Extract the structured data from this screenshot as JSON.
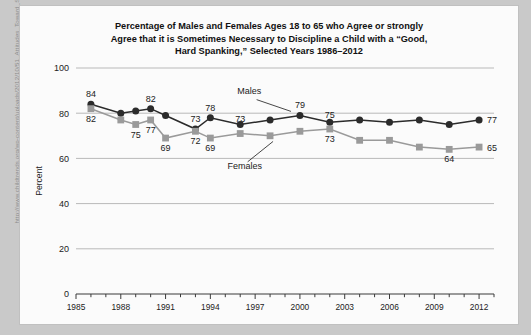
{
  "source_url": "http://www.childtrends.org/wp-content/uploads/2012/10/51_Attitudes_Toward_Spanking.pdf",
  "chart_data": {
    "type": "line",
    "title": "Percentage of Males and Females Ages 18 to 65 who Agree or strongly Agree that it is Sometimes Necessary to Discipline a Child with a “Good, Hard Spanking,” Selected Years 1986–2012",
    "title_lines": [
      "Percentage of Males and Females Ages 18 to 65 who Agree or strongly",
      "Agree that it is Sometimes Necessary to Discipline a Child with a “Good,",
      "Hard Spanking,” Selected Years 1986–2012"
    ],
    "xlabel": "",
    "ylabel": "Percent",
    "ylim": [
      0,
      100
    ],
    "yticks": [
      0,
      20,
      40,
      60,
      80,
      100
    ],
    "xlim": [
      1985,
      2013
    ],
    "xticks": [
      1985,
      1988,
      1991,
      1994,
      1997,
      2000,
      2003,
      2006,
      2009,
      2012
    ],
    "xtick_labels": [
      "1985",
      "1988",
      "1991",
      "1994",
      "1997",
      "2000",
      "2003",
      "2006",
      "2009",
      "2012"
    ],
    "grid": true,
    "legend_position": "inline-annotations",
    "x": [
      1986,
      1988,
      1989,
      1990,
      1991,
      1993,
      1994,
      1996,
      1998,
      2000,
      2002,
      2004,
      2006,
      2008,
      2010,
      2012
    ],
    "series": [
      {
        "name": "Males",
        "color": "#2b2b2b",
        "marker": "circle",
        "values": [
          84,
          80,
          81,
          82,
          79,
          73,
          78,
          75,
          77,
          79,
          76,
          77,
          76,
          77,
          75,
          77
        ]
      },
      {
        "name": "Females",
        "color": "#9a9a9a",
        "marker": "square",
        "values": [
          82,
          77,
          75,
          77,
          69,
          72,
          69,
          71,
          70,
          72,
          73,
          68,
          68,
          65,
          64,
          65
        ]
      }
    ],
    "point_labels": [
      {
        "series": "Males",
        "x": 1986,
        "value": 84,
        "text": "84",
        "pos": "above"
      },
      {
        "series": "Females",
        "x": 1986,
        "value": 82,
        "text": "82",
        "pos": "below"
      },
      {
        "series": "Females",
        "x": 1989,
        "value": 75,
        "text": "75",
        "pos": "below"
      },
      {
        "series": "Females",
        "x": 1990,
        "value": 77,
        "text": "77",
        "pos": "below"
      },
      {
        "series": "Males",
        "x": 1990,
        "value": 82,
        "text": "82",
        "pos": "above"
      },
      {
        "series": "Females",
        "x": 1991,
        "value": 69,
        "text": "69",
        "pos": "below"
      },
      {
        "series": "Males",
        "x": 1993,
        "value": 73,
        "text": "73",
        "pos": "above"
      },
      {
        "series": "Females",
        "x": 1993,
        "value": 72,
        "text": "72",
        "pos": "below"
      },
      {
        "series": "Males",
        "x": 1994,
        "value": 78,
        "text": "78",
        "pos": "above"
      },
      {
        "series": "Females",
        "x": 1994,
        "value": 69,
        "text": "69",
        "pos": "below"
      },
      {
        "series": "Males",
        "x": 1996,
        "value": 73,
        "text": "73",
        "pos": "above"
      },
      {
        "series": "Males",
        "x": 2000,
        "value": 79,
        "text": "79",
        "pos": "above"
      },
      {
        "series": "Males",
        "x": 2002,
        "value": 75,
        "text": "75",
        "pos": "above"
      },
      {
        "series": "Females",
        "x": 2002,
        "value": 73,
        "text": "73",
        "pos": "below"
      },
      {
        "series": "Females",
        "x": 2010,
        "value": 64,
        "text": "64",
        "pos": "below"
      },
      {
        "series": "Males",
        "x": 2012,
        "value": 77,
        "text": "77",
        "pos": "right"
      },
      {
        "series": "Females",
        "x": 2012,
        "value": 65,
        "text": "65",
        "pos": "right"
      }
    ],
    "annotations": [
      {
        "text": "Males",
        "target_x": 2000,
        "target_y": 79
      },
      {
        "text": "Females",
        "target_x": 1998,
        "target_y": 70
      }
    ]
  },
  "colors": {
    "page_background": "#c9c9c9",
    "card_background": "#fbfbfb",
    "males": "#2b2b2b",
    "females": "#9a9a9a",
    "gridline": "#b9b9b9",
    "axis": "#3a3a3a",
    "text": "#111111"
  }
}
